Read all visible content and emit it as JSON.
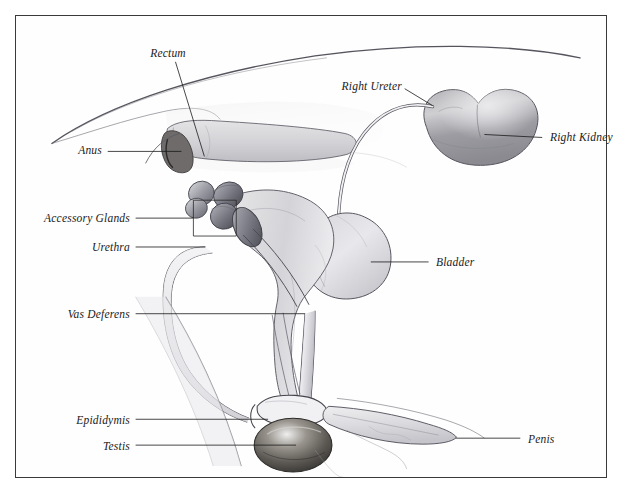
{
  "figure": {
    "kind": "anatomical-illustration",
    "style": "pencil / graphite shaded line drawing",
    "border_color": "#3a3a3a",
    "background_color": "#ffffff",
    "ink_color": "#4a4a52",
    "label_color": "#1a1a1a"
  },
  "labels": [
    {
      "id": "rectum",
      "text": "Rectum",
      "anchor": "center",
      "text_x": 152,
      "text_y": 38,
      "leader": [
        [
          160,
          46
        ],
        [
          189,
          141
        ]
      ]
    },
    {
      "id": "right-ureter",
      "text": "Right Ureter",
      "anchor": "right",
      "text_x": 386,
      "text_y": 71,
      "leader": [
        [
          390,
          73
        ],
        [
          418,
          90
        ]
      ]
    },
    {
      "id": "right-kidney",
      "text": "Right Kidney",
      "anchor": "left",
      "text_x": 534,
      "text_y": 122,
      "leader": [
        [
          528,
          122
        ],
        [
          470,
          119
        ]
      ]
    },
    {
      "id": "anus",
      "text": "Anus",
      "anchor": "right",
      "text_x": 86,
      "text_y": 135,
      "leader": [
        [
          92,
          136
        ],
        [
          166,
          136
        ]
      ]
    },
    {
      "id": "accessory-glands",
      "text": "Accessory Glands",
      "anchor": "right",
      "text_x": 114,
      "text_y": 203,
      "leader": [
        [
          120,
          203
        ],
        [
          178,
          203
        ]
      ]
    },
    {
      "id": "urethra",
      "text": "Urethra",
      "anchor": "right",
      "text_x": 114,
      "text_y": 232,
      "leader": [
        [
          120,
          232
        ],
        [
          190,
          232
        ]
      ]
    },
    {
      "id": "bladder",
      "text": "Bladder",
      "anchor": "left",
      "text_x": 420,
      "text_y": 247,
      "leader": [
        [
          414,
          247
        ],
        [
          356,
          247
        ]
      ]
    },
    {
      "id": "vas-deferens",
      "text": "Vas Deferens",
      "anchor": "right",
      "text_x": 114,
      "text_y": 299,
      "leader": [
        [
          120,
          299
        ],
        [
          290,
          299
        ]
      ]
    },
    {
      "id": "epididymis",
      "text": "Epididymis",
      "anchor": "right",
      "text_x": 114,
      "text_y": 405,
      "leader": [
        [
          120,
          405
        ],
        [
          253,
          405
        ]
      ]
    },
    {
      "id": "testis",
      "text": "Testis",
      "anchor": "right",
      "text_x": 114,
      "text_y": 431,
      "leader": [
        [
          120,
          431
        ],
        [
          281,
          431
        ]
      ]
    },
    {
      "id": "penis",
      "text": "Penis",
      "anchor": "left",
      "text_x": 512,
      "text_y": 424,
      "leader": [
        [
          506,
          424
        ],
        [
          441,
          424
        ]
      ]
    }
  ],
  "bracket": {
    "id": "accessory-glands-bracket",
    "points": [
      [
        178,
        203
      ],
      [
        178,
        185
      ],
      [
        221,
        185
      ],
      [
        221,
        221
      ],
      [
        178,
        221
      ],
      [
        178,
        203
      ]
    ]
  }
}
